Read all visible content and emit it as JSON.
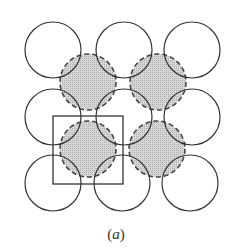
{
  "figure": {
    "caption_open": "(",
    "caption_letter": "a",
    "caption_close": ")",
    "open_circle_stroke": "#333333",
    "shaded_fill": "#c8c8c8",
    "shaded_stroke": "#444444",
    "radius": 28,
    "open_circles": [
      {
        "cx": 53,
        "cy": 50
      },
      {
        "cx": 124,
        "cy": 50
      },
      {
        "cx": 192,
        "cy": 50
      },
      {
        "cx": 53,
        "cy": 117
      },
      {
        "cx": 124,
        "cy": 117
      },
      {
        "cx": 192,
        "cy": 117
      },
      {
        "cx": 53,
        "cy": 183
      },
      {
        "cx": 122,
        "cy": 183
      },
      {
        "cx": 190,
        "cy": 183
      }
    ],
    "shaded_circles": [
      {
        "cx": 88,
        "cy": 82
      },
      {
        "cx": 158,
        "cy": 82
      },
      {
        "cx": 88,
        "cy": 149
      },
      {
        "cx": 157,
        "cy": 149
      }
    ],
    "unit_cell_square": {
      "x": 53,
      "y": 116,
      "width": 70,
      "height": 68
    }
  }
}
